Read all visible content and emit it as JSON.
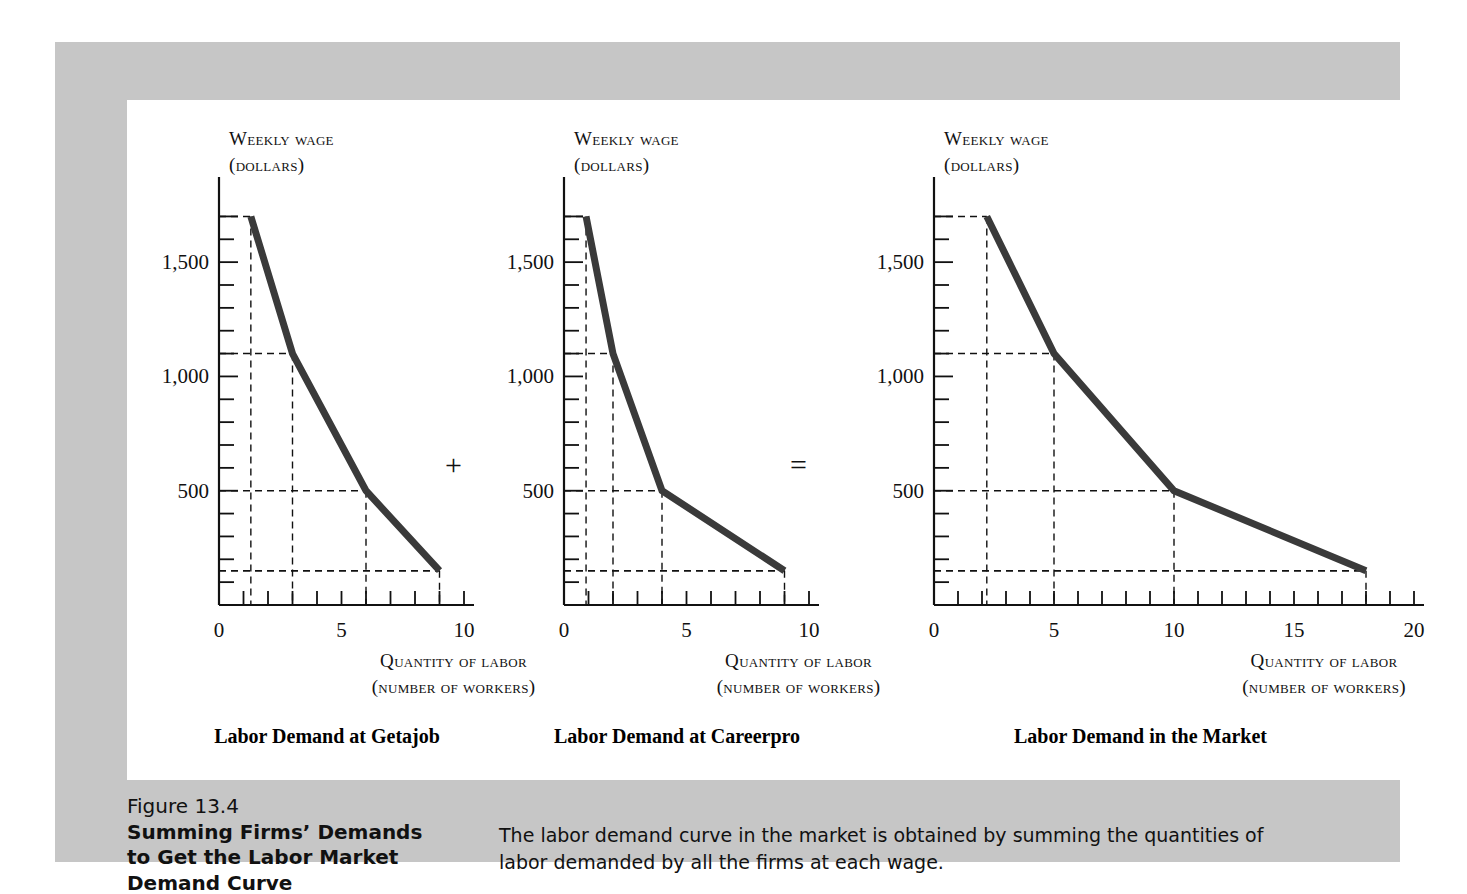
{
  "figure": {
    "number": "Figure 13.4",
    "title_lines": [
      "Summing Firms’ Demands",
      "to Get the Labor Market",
      "Demand Curve"
    ],
    "caption": "The labor demand curve in the market is obtained by summing the quantities of labor demanded by all the firms at each wage.",
    "operators": {
      "plus": "+",
      "equals": "="
    },
    "colors": {
      "panel_gray": "#c6c6c6",
      "panel_white": "#ffffff",
      "curve": "#3a3a3a",
      "axis": "#111111",
      "text": "#111111"
    }
  },
  "chart_data": [
    {
      "type": "line",
      "title": "Labor Demand at Getajob",
      "xlabel": "Quantity of labor",
      "xlabel_units": "(number of workers)",
      "ylabel": "Weekly wage",
      "ylabel_units": "(dollars)",
      "xlim": [
        0,
        10
      ],
      "ylim": [
        0,
        1750
      ],
      "xticks": [
        0,
        1,
        2,
        3,
        4,
        5,
        6,
        7,
        8,
        9,
        10
      ],
      "xtick_labels": [
        {
          "value": 0,
          "label": "0"
        },
        {
          "value": 5,
          "label": "5"
        },
        {
          "value": 10,
          "label": "10"
        }
      ],
      "yticks": [
        100,
        200,
        300,
        400,
        500,
        600,
        700,
        800,
        900,
        1000,
        1100,
        1200,
        1300,
        1400,
        1500,
        1600,
        1700
      ],
      "ytick_labels": [
        {
          "value": 500,
          "label": "500"
        },
        {
          "value": 1000,
          "label": "1,000"
        },
        {
          "value": 1500,
          "label": "1,500"
        }
      ],
      "grid": false,
      "series": [
        {
          "name": "Labor demand at Getajob",
          "x": [
            1.3,
            3,
            6,
            9
          ],
          "y": [
            1700,
            1100,
            500,
            150
          ]
        }
      ],
      "guide_lines": [
        {
          "x": 1.3,
          "y": 1700
        },
        {
          "x": 3,
          "y": 1100
        },
        {
          "x": 6,
          "y": 500
        },
        {
          "x": 9,
          "y": 150
        }
      ]
    },
    {
      "type": "line",
      "title": "Labor Demand at Careerpro",
      "xlabel": "Quantity of labor",
      "xlabel_units": "(number of workers)",
      "ylabel": "Weekly wage",
      "ylabel_units": "(dollars)",
      "xlim": [
        0,
        10
      ],
      "ylim": [
        0,
        1750
      ],
      "xticks": [
        0,
        1,
        2,
        3,
        4,
        5,
        6,
        7,
        8,
        9,
        10
      ],
      "xtick_labels": [
        {
          "value": 0,
          "label": "0"
        },
        {
          "value": 5,
          "label": "5"
        },
        {
          "value": 10,
          "label": "10"
        }
      ],
      "yticks": [
        100,
        200,
        300,
        400,
        500,
        600,
        700,
        800,
        900,
        1000,
        1100,
        1200,
        1300,
        1400,
        1500,
        1600,
        1700
      ],
      "ytick_labels": [
        {
          "value": 500,
          "label": "500"
        },
        {
          "value": 1000,
          "label": "1,000"
        },
        {
          "value": 1500,
          "label": "1,500"
        }
      ],
      "grid": false,
      "series": [
        {
          "name": "Labor demand at Careerpro",
          "x": [
            0.9,
            2,
            4,
            9
          ],
          "y": [
            1700,
            1100,
            500,
            150
          ]
        }
      ],
      "guide_lines": [
        {
          "x": 0.9,
          "y": 1700
        },
        {
          "x": 2,
          "y": 1100
        },
        {
          "x": 4,
          "y": 500
        },
        {
          "x": 9,
          "y": 150
        }
      ]
    },
    {
      "type": "line",
      "title": "Labor Demand in the Market",
      "xlabel": "Quantity of labor",
      "xlabel_units": "(number of workers)",
      "ylabel": "Weekly wage",
      "ylabel_units": "(dollars)",
      "xlim": [
        0,
        20
      ],
      "ylim": [
        0,
        1750
      ],
      "xticks": [
        0,
        1,
        2,
        3,
        4,
        5,
        6,
        7,
        8,
        9,
        10,
        11,
        12,
        13,
        14,
        15,
        16,
        17,
        18,
        19,
        20
      ],
      "xtick_labels": [
        {
          "value": 0,
          "label": "0"
        },
        {
          "value": 5,
          "label": "5"
        },
        {
          "value": 10,
          "label": "10"
        },
        {
          "value": 15,
          "label": "15"
        },
        {
          "value": 20,
          "label": "20"
        }
      ],
      "yticks": [
        100,
        200,
        300,
        400,
        500,
        600,
        700,
        800,
        900,
        1000,
        1100,
        1200,
        1300,
        1400,
        1500,
        1600,
        1700
      ],
      "ytick_labels": [
        {
          "value": 500,
          "label": "500"
        },
        {
          "value": 1000,
          "label": "1,000"
        },
        {
          "value": 1500,
          "label": "1,500"
        }
      ],
      "grid": false,
      "series": [
        {
          "name": "Labor demand in the market",
          "x": [
            2.2,
            5,
            10,
            18
          ],
          "y": [
            1700,
            1100,
            500,
            150
          ]
        }
      ],
      "guide_lines": [
        {
          "x": 2.2,
          "y": 1700
        },
        {
          "x": 5,
          "y": 1100
        },
        {
          "x": 10,
          "y": 500
        },
        {
          "x": 18,
          "y": 150
        }
      ]
    }
  ]
}
